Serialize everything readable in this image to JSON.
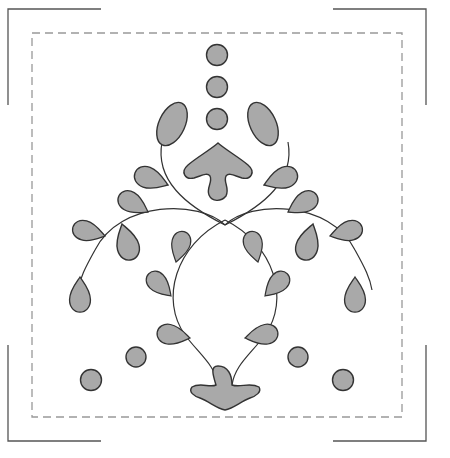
{
  "pattern": {
    "type": "appliqué embroidery template",
    "colors": {
      "fill": "#a9a9a9",
      "outline": "#333333",
      "border": "#999999",
      "crop_marks": "#555555",
      "background": "#ffffff"
    },
    "border": {
      "style": "dashed",
      "x": 32,
      "y": 33,
      "width": 370,
      "height": 384
    },
    "crop_marks": [
      "top-left",
      "top-right",
      "bottom-left",
      "bottom-right"
    ],
    "dots_top_count": 3,
    "dots_bottom_count": 4,
    "leaf_count": 22
  }
}
